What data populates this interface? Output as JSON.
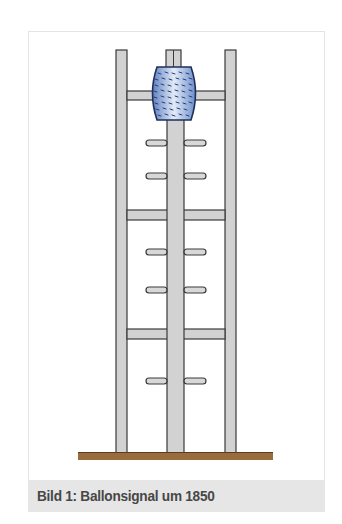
{
  "figure": {
    "caption": "Bild 1:  Ballonsignal um 1850",
    "colors": {
      "pole_fill": "#d2d2d2",
      "pole_stroke": "#3a3a3a",
      "balloon_edge": "#5f82c2",
      "balloon_center": "#e3ebf7",
      "balloon_marks": "#2a3f78",
      "ground": "#9a6b3b",
      "caption_bg": "#e6e6e6",
      "caption_text": "#474747"
    }
  }
}
